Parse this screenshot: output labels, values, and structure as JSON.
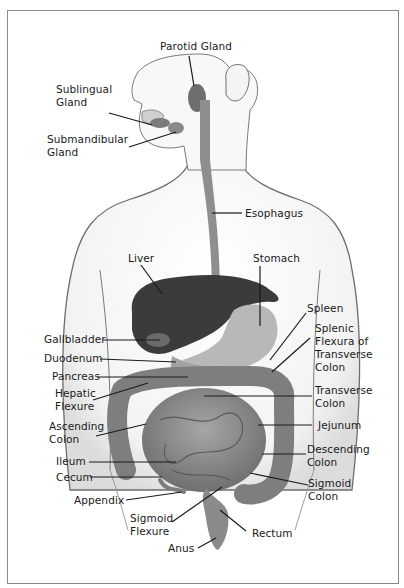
{
  "diagram": {
    "type": "anatomical-illustration",
    "colors": {
      "frame": "#8a8a8a",
      "body_outline": "#6e6e6e",
      "body_fill": "#f1f1f1",
      "organ_dark": "#3b3b3b",
      "organ_mid": "#8e8e8e",
      "organ_light": "#b8b8b8",
      "leader_line": "#1a1a1a",
      "text": "#1a1a1a"
    },
    "labels": {
      "parotid_gland": "Parotid Gland",
      "sublingual_gland": "Sublingual\nGland",
      "submandibular_gland": "Submandibular\nGland",
      "esophagus": "Esophagus",
      "liver": "Liver",
      "stomach": "Stomach",
      "spleen": "Spleen",
      "splenic_flexura": "Splenic\nFlexura of\nTransverse\nColon",
      "gallbladder": "Gallbladder",
      "duodenum": "Duodenum",
      "pancreas": "Pancreas",
      "hepatic_flexure": "Hepatic\nFlexure",
      "transverse_colon": "Transverse\nColon",
      "ascending_colon": "Ascending\nColon",
      "jejunum": "Jejunum",
      "descending_colon": "Descending\nColon",
      "ileum": "Ileum",
      "cecum": "Cecum",
      "sigmoid_colon": "Sigmoid\nColon",
      "appendix": "Appendix",
      "sigmoid_flexure": "Sigmoid\nFlexure",
      "rectum": "Rectum",
      "anus": "Anus"
    }
  }
}
